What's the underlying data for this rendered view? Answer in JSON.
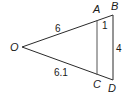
{
  "figure": {
    "type": "similar-triangles",
    "vertices": {
      "O": {
        "label": "O",
        "x": 22,
        "y": 47
      },
      "A": {
        "label": "A",
        "x": 97,
        "y": 19
      },
      "B": {
        "label": "B",
        "x": 113,
        "y": 15
      },
      "C": {
        "label": "C",
        "x": 97,
        "y": 75
      },
      "D": {
        "label": "D",
        "x": 113,
        "y": 80
      }
    },
    "lengths": {
      "OA": "6",
      "AB": "1",
      "BD": "4",
      "OC": "6.1"
    },
    "colors": {
      "line": "#2a2a2a",
      "inner_line": "#555555",
      "text": "#1a1a1a",
      "background": "#ffffff"
    }
  }
}
